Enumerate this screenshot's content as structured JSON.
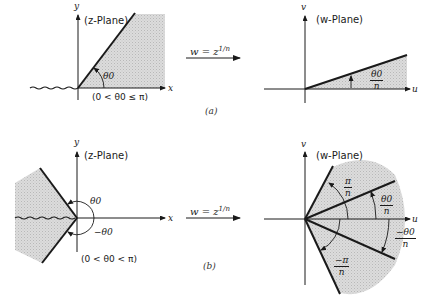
{
  "figure": {
    "panel_a": {
      "caption": "(a)",
      "z_plane": {
        "title": "(z-Plane)",
        "x_axis_label": "x",
        "y_axis_label": "y",
        "angle_label": "θ0",
        "condition": "(0 < θ0 ≤ π)"
      },
      "mapping": "w = z^(1/n)",
      "mapping_lhs": "w = z",
      "mapping_exp": "1/n",
      "w_plane": {
        "title": "(w-Plane)",
        "u_axis_label": "u",
        "v_axis_label": "v",
        "angle_num": "θ0",
        "angle_den": "n"
      }
    },
    "panel_b": {
      "caption": "(b)",
      "z_plane": {
        "title": "(z-Plane)",
        "x_axis_label": "x",
        "y_axis_label": "y",
        "angle_upper_label": "θ0",
        "angle_lower_label": "−θ0",
        "condition": "(0 < θ0 < π)"
      },
      "mapping": "w = z^(1/n)",
      "mapping_lhs": "w = z",
      "mapping_exp": "1/n",
      "w_plane": {
        "title": "(w-Plane)",
        "u_axis_label": "u",
        "v_axis_label": "v",
        "pi_num": "π",
        "pi_den": "n",
        "theta_num": "θ0",
        "theta_den": "n",
        "neg_theta_num": "−θ0",
        "neg_theta_den": "n",
        "neg_pi_num": "−π",
        "neg_pi_den": "n"
      }
    },
    "colors": {
      "ink": "#1a1a1a",
      "shade": "#d4d4d4",
      "background": "#ffffff"
    }
  }
}
